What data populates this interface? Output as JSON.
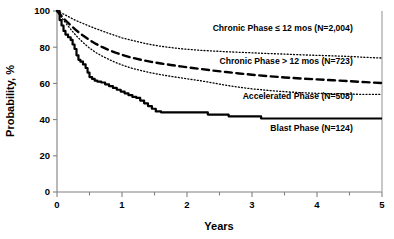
{
  "chart_data": {
    "type": "line",
    "title": "",
    "xlabel": "Years",
    "ylabel": "Probability, %",
    "xlim": [
      0,
      5
    ],
    "ylim": [
      0,
      100
    ],
    "xticks": [
      0,
      1,
      2,
      3,
      4,
      5
    ],
    "xticklabels": [
      "0",
      "1",
      "2",
      "3",
      "4",
      "5"
    ],
    "xminorticks": [
      0.5,
      1.5,
      2.5,
      3.5,
      4.5
    ],
    "yticks": [
      0,
      20,
      40,
      60,
      80,
      100
    ],
    "yticklabels": [
      "0",
      "20",
      "40",
      "60",
      "80",
      "100"
    ],
    "grid": false,
    "legend_position": "inline-annotations",
    "series": [
      {
        "name": "Chronic Phase ≤ 12 mos (N=2,004)",
        "label": "Chronic Phase ≤ 12 mos (N=2,004)",
        "n": 2004,
        "style": "dotted",
        "stroke_width": 1.3,
        "dasharray": "1,2.2",
        "label_x": 4.55,
        "label_y": 89,
        "label_anchor": "end",
        "points": [
          [
            0.0,
            100.0
          ],
          [
            0.05,
            99.2
          ],
          [
            0.1,
            98.3
          ],
          [
            0.15,
            97.4
          ],
          [
            0.2,
            96.4
          ],
          [
            0.25,
            95.5
          ],
          [
            0.3,
            94.6
          ],
          [
            0.4,
            93.1
          ],
          [
            0.5,
            91.6
          ],
          [
            0.6,
            90.2
          ],
          [
            0.7,
            88.9
          ],
          [
            0.8,
            87.6
          ],
          [
            0.9,
            86.4
          ],
          [
            1.0,
            85.2
          ],
          [
            1.15,
            83.8
          ],
          [
            1.3,
            82.5
          ],
          [
            1.45,
            81.4
          ],
          [
            1.6,
            80.5
          ],
          [
            1.75,
            79.8
          ],
          [
            1.9,
            79.2
          ],
          [
            2.05,
            78.7
          ],
          [
            2.2,
            78.3
          ],
          [
            2.4,
            77.9
          ],
          [
            2.6,
            77.5
          ],
          [
            2.8,
            77.2
          ],
          [
            3.0,
            76.9
          ],
          [
            3.25,
            76.5
          ],
          [
            3.5,
            76.2
          ],
          [
            3.75,
            75.8
          ],
          [
            4.0,
            75.5
          ],
          [
            4.25,
            75.2
          ],
          [
            4.5,
            74.9
          ],
          [
            4.75,
            74.4
          ],
          [
            5.0,
            74.0
          ]
        ]
      },
      {
        "name": "Chronic Phase > 12 mos (N=723)",
        "label": "Chronic Phase > 12 mos (N=723)",
        "n": 723,
        "style": "dashed",
        "stroke_width": 2.4,
        "dasharray": "7,4.5",
        "label_x": 4.55,
        "label_y": 70.5,
        "label_anchor": "end",
        "points": [
          [
            0.0,
            100.0
          ],
          [
            0.05,
            98.0
          ],
          [
            0.1,
            96.0
          ],
          [
            0.15,
            94.2
          ],
          [
            0.2,
            92.4
          ],
          [
            0.25,
            90.8
          ],
          [
            0.3,
            89.2
          ],
          [
            0.4,
            86.4
          ],
          [
            0.5,
            84.0
          ],
          [
            0.6,
            81.8
          ],
          [
            0.7,
            80.0
          ],
          [
            0.8,
            78.4
          ],
          [
            0.9,
            77.0
          ],
          [
            1.0,
            75.8
          ],
          [
            1.15,
            74.2
          ],
          [
            1.3,
            73.0
          ],
          [
            1.45,
            71.9
          ],
          [
            1.6,
            71.0
          ],
          [
            1.75,
            70.2
          ],
          [
            1.9,
            69.4
          ],
          [
            2.05,
            68.7
          ],
          [
            2.2,
            68.0
          ],
          [
            2.4,
            67.1
          ],
          [
            2.6,
            66.3
          ],
          [
            2.8,
            65.5
          ],
          [
            3.0,
            64.8
          ],
          [
            3.25,
            64.0
          ],
          [
            3.5,
            63.3
          ],
          [
            3.75,
            62.7
          ],
          [
            4.0,
            62.2
          ],
          [
            4.25,
            61.7
          ],
          [
            4.5,
            61.2
          ],
          [
            4.75,
            60.7
          ],
          [
            5.0,
            60.2
          ]
        ]
      },
      {
        "name": "Accelerated Phase (N=508)",
        "label": "Accelerated Phase (N=508)",
        "n": 508,
        "style": "dotted",
        "stroke_width": 1.3,
        "dasharray": "1,2.2",
        "label_x": 4.55,
        "label_y": 51.5,
        "label_anchor": "end",
        "points": [
          [
            0.0,
            100.0
          ],
          [
            0.05,
            97.4
          ],
          [
            0.1,
            95.0
          ],
          [
            0.15,
            92.6
          ],
          [
            0.2,
            90.4
          ],
          [
            0.25,
            88.2
          ],
          [
            0.3,
            86.2
          ],
          [
            0.4,
            82.6
          ],
          [
            0.5,
            79.5
          ],
          [
            0.6,
            77.0
          ],
          [
            0.7,
            75.0
          ],
          [
            0.8,
            73.2
          ],
          [
            0.9,
            71.6
          ],
          [
            1.0,
            70.2
          ],
          [
            1.15,
            68.4
          ],
          [
            1.3,
            67.0
          ],
          [
            1.45,
            65.8
          ],
          [
            1.6,
            64.8
          ],
          [
            1.75,
            63.9
          ],
          [
            1.9,
            63.1
          ],
          [
            2.05,
            62.3
          ],
          [
            2.2,
            61.5
          ],
          [
            2.35,
            60.6
          ],
          [
            2.5,
            59.6
          ],
          [
            2.65,
            58.7
          ],
          [
            2.8,
            57.9
          ],
          [
            3.0,
            57.0
          ],
          [
            3.2,
            56.3
          ],
          [
            3.4,
            55.7
          ],
          [
            3.6,
            55.2
          ],
          [
            3.8,
            54.8
          ],
          [
            4.0,
            54.5
          ],
          [
            4.3,
            54.2
          ],
          [
            4.6,
            54.0
          ],
          [
            5.0,
            53.9
          ]
        ]
      },
      {
        "name": "Blast Phase (N=124)",
        "label": "Blast Phase (N=124)",
        "n": 124,
        "style": "solid",
        "stroke_width": 2.2,
        "dasharray": "",
        "label_x": 4.55,
        "label_y": 33.5,
        "label_anchor": "end",
        "step": true,
        "points": [
          [
            0.0,
            100.0
          ],
          [
            0.04,
            95.0
          ],
          [
            0.07,
            92.0
          ],
          [
            0.1,
            89.0
          ],
          [
            0.13,
            87.0
          ],
          [
            0.17,
            85.5
          ],
          [
            0.21,
            84.0
          ],
          [
            0.24,
            81.5
          ],
          [
            0.27,
            79.0
          ],
          [
            0.3,
            75.5
          ],
          [
            0.33,
            73.0
          ],
          [
            0.36,
            72.0
          ],
          [
            0.4,
            70.5
          ],
          [
            0.44,
            68.5
          ],
          [
            0.47,
            66.0
          ],
          [
            0.5,
            63.5
          ],
          [
            0.54,
            62.5
          ],
          [
            0.58,
            61.5
          ],
          [
            0.62,
            61.0
          ],
          [
            0.68,
            60.5
          ],
          [
            0.74,
            59.5
          ],
          [
            0.8,
            58.5
          ],
          [
            0.86,
            57.5
          ],
          [
            0.92,
            56.5
          ],
          [
            0.98,
            55.5
          ],
          [
            1.04,
            54.5
          ],
          [
            1.1,
            53.5
          ],
          [
            1.16,
            52.5
          ],
          [
            1.22,
            52.0
          ],
          [
            1.28,
            50.5
          ],
          [
            1.34,
            49.0
          ],
          [
            1.4,
            47.5
          ],
          [
            1.46,
            46.0
          ],
          [
            1.52,
            44.5
          ],
          [
            1.6,
            44.0
          ],
          [
            2.28,
            44.0
          ],
          [
            2.32,
            42.8
          ],
          [
            2.6,
            42.8
          ],
          [
            2.64,
            41.8
          ],
          [
            3.08,
            41.8
          ],
          [
            3.14,
            40.6
          ],
          [
            5.0,
            40.6
          ]
        ]
      }
    ]
  },
  "axes": {
    "x_title": "Years",
    "y_title": "Probability, %"
  }
}
